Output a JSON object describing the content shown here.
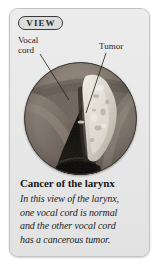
{
  "card": {
    "badge_label": "VIEW",
    "background_color": "#e9e9e9",
    "border_color": "#c2c2c2"
  },
  "annotations": {
    "vocal_cord_label": "Vocal\ncord",
    "tumor_label": "Tumor"
  },
  "figure": {
    "name": "laryngoscopic-view-of-larynx",
    "shape": "circle"
  },
  "caption": {
    "title": "Cancer of the larynx",
    "lines": [
      "In this view of the larynx,",
      "one vocal cord is normal",
      "and the other vocal cord",
      "has a cancerous tumor."
    ]
  }
}
